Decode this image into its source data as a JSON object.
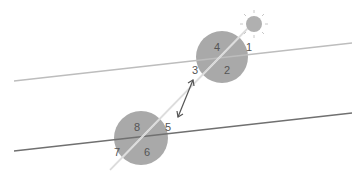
{
  "diagram": {
    "type": "parallel-lines-transversal",
    "colors": {
      "background": "#ffffff",
      "circle": "#a9a9a9",
      "upper_line": "#bdbdbd",
      "lower_line": "#707070",
      "transversal": "#d9d9d9",
      "arrow": "#555555",
      "sun": "#b0b0b0",
      "sun_rays": "#c8c8c8",
      "label": "#555555"
    },
    "upper_intersection": {
      "labels": [
        "1",
        "2",
        "3",
        "4"
      ]
    },
    "lower_intersection": {
      "labels": [
        "5",
        "6",
        "7",
        "8"
      ]
    },
    "sun_icon": "sun-icon",
    "arrow_icon": "double-headed-arrow-icon"
  }
}
